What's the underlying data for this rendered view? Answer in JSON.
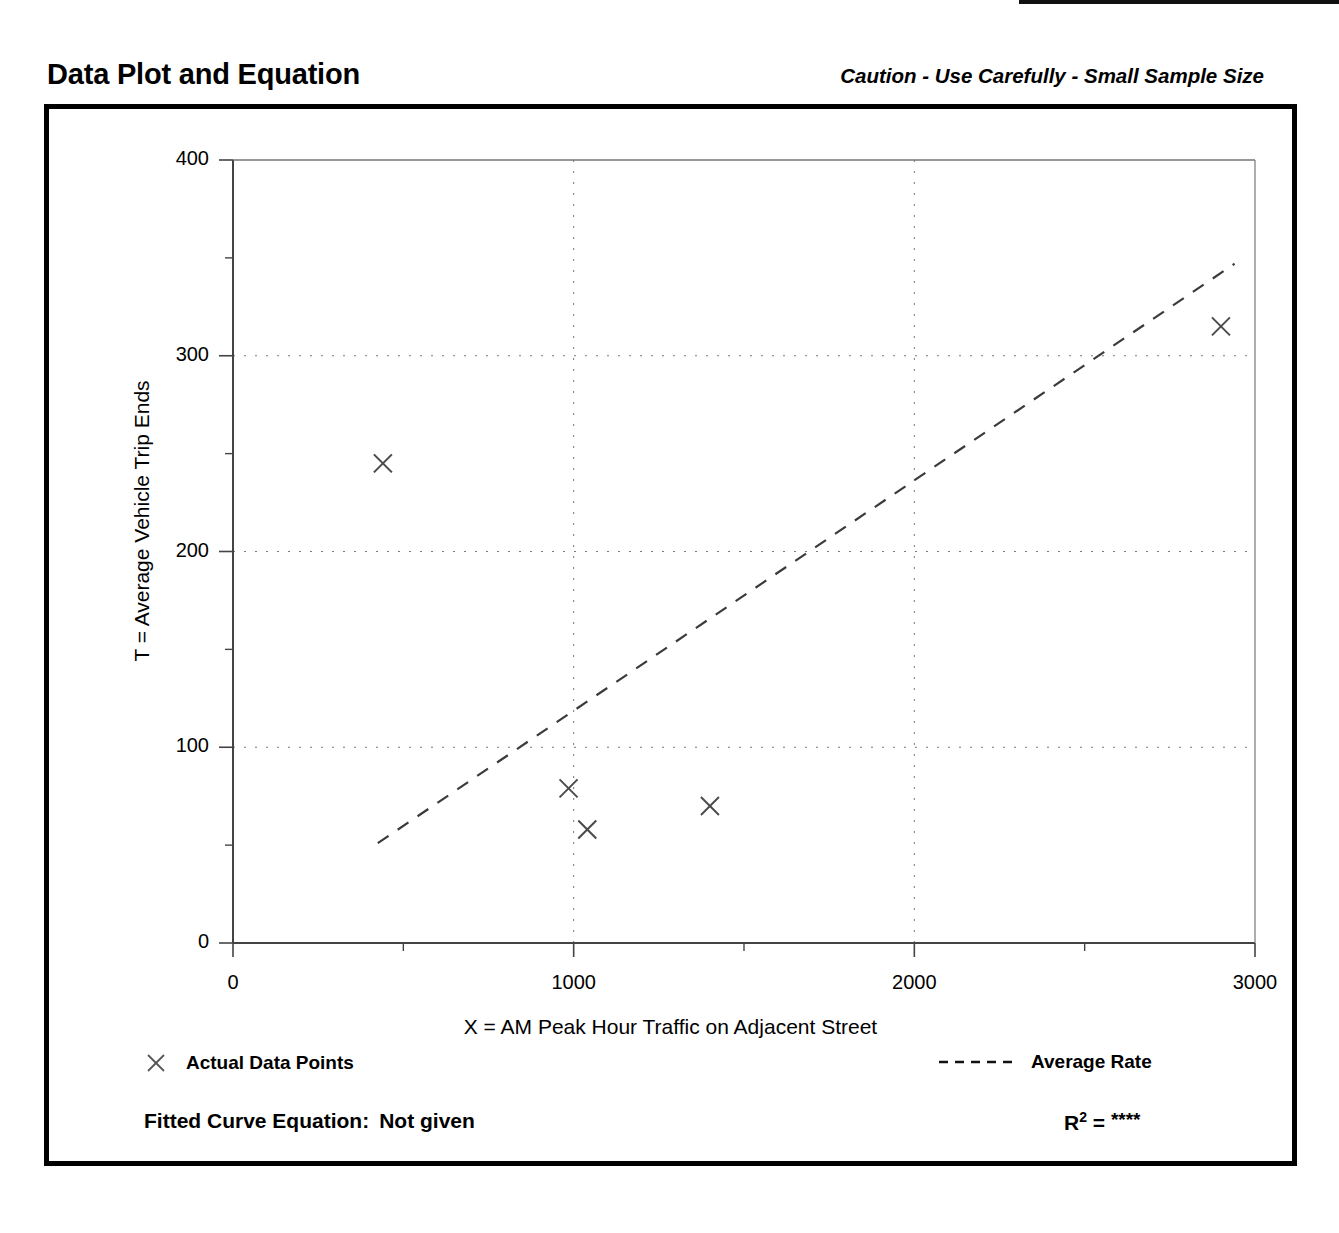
{
  "header": {
    "title": "Data Plot and Equation",
    "caution": "Caution - Use Carefully - Small Sample Size"
  },
  "legend": {
    "points_label": "Actual Data Points",
    "points_marker": "x-marker-icon",
    "rate_label": "Average Rate",
    "rate_marker": "dashed-line-icon"
  },
  "footer": {
    "equation_label": "Fitted Curve Equation:",
    "equation_value": "Not given",
    "rsq_label": "R",
    "rsq_exponent": "2",
    "rsq_equals": "=",
    "rsq_value": "****"
  },
  "chart_data": {
    "type": "scatter",
    "title": "Data Plot and Equation",
    "xlabel": "X = AM Peak Hour Traffic on Adjacent Street",
    "ylabel": "T = Average Vehicle Trip Ends",
    "xlim": [
      0,
      3000
    ],
    "ylim": [
      0,
      400
    ],
    "xticks": [
      0,
      1000,
      2000,
      3000
    ],
    "xtick_labels": [
      "0",
      "1000",
      "2000",
      "3000"
    ],
    "xticks_minor": [
      500,
      1500,
      2500
    ],
    "yticks": [
      0,
      100,
      200,
      300,
      400
    ],
    "ytick_labels": [
      "0",
      "100",
      "200",
      "300",
      "400"
    ],
    "yticks_minor": [
      50,
      150,
      250,
      350
    ],
    "grid": true,
    "grid_style": "dotted",
    "legend_position": "below-axes",
    "series": [
      {
        "name": "Actual Data Points",
        "type": "scatter",
        "marker": "x",
        "points": [
          {
            "x": 440,
            "y": 245
          },
          {
            "x": 985,
            "y": 79
          },
          {
            "x": 1040,
            "y": 58
          },
          {
            "x": 1400,
            "y": 70
          },
          {
            "x": 2900,
            "y": 315
          }
        ]
      },
      {
        "name": "Average Rate",
        "type": "line",
        "style": "dashed",
        "points": [
          {
            "x": 425,
            "y": 51
          },
          {
            "x": 2940,
            "y": 347
          }
        ]
      }
    ]
  }
}
